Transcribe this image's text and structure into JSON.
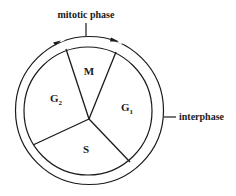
{
  "diagram": {
    "labels": {
      "mitotic_phase": "mitotic phase",
      "interphase": "interphase"
    },
    "segments": [
      {
        "id": "M",
        "label": "M",
        "sub": ""
      },
      {
        "id": "G1",
        "label": "G",
        "sub": "1"
      },
      {
        "id": "S",
        "label": "S",
        "sub": ""
      },
      {
        "id": "G2",
        "label": "G",
        "sub": "2"
      }
    ],
    "colors": {
      "stroke": "#1a1a1a",
      "background": "#ffffff"
    }
  }
}
